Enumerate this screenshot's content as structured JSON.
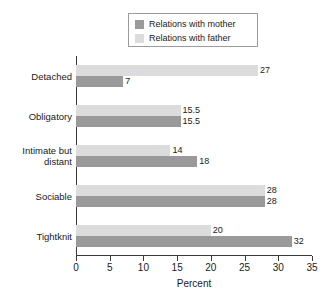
{
  "chart_data": {
    "type": "bar",
    "orientation": "horizontal",
    "title": "",
    "xlabel": "Percent",
    "ylabel": "",
    "xlim": [
      0,
      35
    ],
    "xticks": [
      0,
      5,
      10,
      15,
      20,
      25,
      30,
      35
    ],
    "grid": false,
    "legend_position": "top",
    "categories": [
      "Detached",
      "Obligatory",
      "Intimate but distant",
      "Sociable",
      "Tightknit"
    ],
    "series": [
      {
        "name": "Relations with mother",
        "color": "#9a9a9a",
        "values": [
          7,
          15.5,
          18,
          28,
          32
        ],
        "value_labels": [
          "7",
          "15.5",
          "18",
          "28",
          "32"
        ]
      },
      {
        "name": "Relations with father",
        "color": "#dcdcdc",
        "values": [
          27,
          15.5,
          14,
          28,
          20
        ],
        "value_labels": [
          "27",
          "15.5",
          "14",
          "28",
          "20"
        ]
      }
    ]
  },
  "legend": {
    "items": [
      {
        "label": "Relations with mother",
        "swatch": "mother"
      },
      {
        "label": "Relations with father",
        "swatch": "father"
      }
    ]
  },
  "axis": {
    "x_label": "Percent",
    "tick_labels": [
      "0",
      "5",
      "10",
      "15",
      "20",
      "25",
      "30",
      "35"
    ]
  },
  "categories": [
    {
      "line1": "Detached",
      "line2": ""
    },
    {
      "line1": "Obligatory",
      "line2": ""
    },
    {
      "line1": "Intimate but",
      "line2": "distant"
    },
    {
      "line1": "Sociable",
      "line2": ""
    },
    {
      "line1": "Tightknit",
      "line2": ""
    }
  ]
}
